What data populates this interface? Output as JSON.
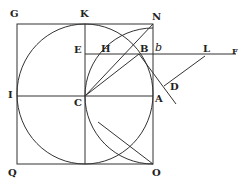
{
  "figure": {
    "type": "geometric construction",
    "labels": {
      "G": "G",
      "K": "K",
      "N": "N",
      "E": "E",
      "H": "H",
      "B": "B",
      "b": "b",
      "L": "L",
      "F": "F",
      "I": "I",
      "C": "C",
      "A": "A",
      "D": "D",
      "Q": "Q",
      "O": "O"
    },
    "colors": {
      "ink": "#333333",
      "background": "#ffffff"
    }
  }
}
